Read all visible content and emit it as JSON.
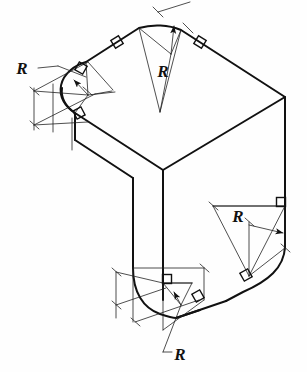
{
  "drawing": {
    "title": "Isometric drawing of a stepped block with filleted (rounded) corners",
    "type": "isometric-technical-drawing",
    "projection": "isometric",
    "background_color": "#fefefe",
    "line_color": "#111111",
    "construction_line_color": "#2a2a2a",
    "object_line_width": 2.0,
    "construction_line_width": 0.7,
    "labels": [
      {
        "id": "r-top-left",
        "text": "R",
        "x": 22,
        "y": 74,
        "position": "upper-left",
        "note": "radius callout with horizontal leader to top-left rounded corner"
      },
      {
        "id": "r-top-center",
        "text": "R",
        "x": 163,
        "y": 77,
        "position": "top-center",
        "note": "radius callout inside top face for rear rounded corner"
      },
      {
        "id": "r-right",
        "text": "R",
        "x": 238,
        "y": 222,
        "position": "right",
        "note": "radius callout for lower-right rounded corner"
      },
      {
        "id": "r-bottom",
        "text": "R",
        "x": 180,
        "y": 360,
        "position": "bottom",
        "note": "radius callout with leader to bottom rounded corner"
      }
    ],
    "rounded_corners": [
      {
        "id": "corner-top-rear",
        "label": "R",
        "location": "top rear corner of top face"
      },
      {
        "id": "corner-top-left",
        "label": "R",
        "location": "left corner of top face / upper-left vertical edge"
      },
      {
        "id": "corner-right-low",
        "label": "R",
        "location": "lower right vertical edge of body"
      },
      {
        "id": "corner-bottom-leg",
        "label": "R",
        "location": "bottom of the left leg / step"
      }
    ],
    "annotation_symbols": {
      "perpendicular_square": "small open square at each tangent point indicating 90° tangency",
      "arrowhead": "solid filled arrowhead on each radius dimension line",
      "slash_tick": "short 45° slash tick terminating extension/dimension lines"
    },
    "outline_points": {
      "top_face": [
        {
          "name": "top-rear-vertex",
          "x": 160,
          "y": 16
        },
        {
          "name": "right-vertex",
          "x": 285,
          "y": 97
        },
        {
          "name": "front-vertex",
          "x": 163,
          "y": 170
        },
        {
          "name": "left-vertex",
          "x": 70,
          "y": 72
        }
      ],
      "body": [
        {
          "name": "right-lower",
          "x": 285,
          "y": 270
        },
        {
          "name": "front-lower",
          "x": 163,
          "y": 300
        },
        {
          "name": "step-inner",
          "x": 133,
          "y": 188
        },
        {
          "name": "leg-outer-left",
          "x": 62,
          "y": 148
        },
        {
          "name": "leg-bottom-left",
          "x": 95,
          "y": 300
        }
      ]
    }
  }
}
